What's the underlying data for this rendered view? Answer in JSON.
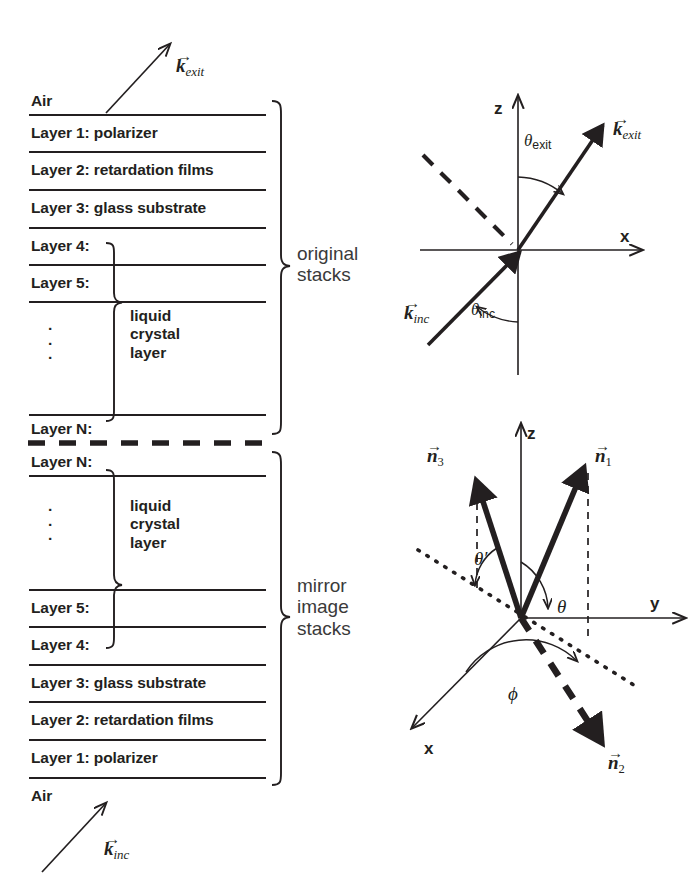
{
  "figure": {
    "background": "#ffffff",
    "ink": "#231f20",
    "side_label_color": "#3a3a3a"
  },
  "stack_original": {
    "group_label": "original stacks",
    "group_label_line1": "original",
    "group_label_line2": "stacks",
    "top_medium": "Air",
    "layers": [
      "Layer 1: polarizer",
      "Layer 2: retardation films",
      "Layer 3: glass substrate",
      "Layer 4:",
      "Layer 5:",
      "Layer N:"
    ],
    "ellipsis": "·",
    "lc_label_line1": "liquid",
    "lc_label_line2": "crystal",
    "lc_label_line3": "layer",
    "arrow_label": "k",
    "arrow_label_sub": "exit"
  },
  "stack_mirror": {
    "group_label": "mirror image stacks",
    "group_label_line1": "mirror",
    "group_label_line2": "image",
    "group_label_line3": "stacks",
    "bottom_medium": "Air",
    "layers": [
      "Layer N:",
      "Layer 5:",
      "Layer 4:",
      "Layer 3: glass substrate",
      "Layer 2: retardation films",
      "Layer 1: polarizer"
    ],
    "ellipsis": "·",
    "lc_label_line1": "liquid",
    "lc_label_line2": "crystal",
    "lc_label_line3": "layer",
    "arrow_label": "k",
    "arrow_label_sub": "inc"
  },
  "coord_top": {
    "axis_z": "z",
    "axis_x": "x",
    "angle_exit": "θ",
    "angle_exit_sub": "exit",
    "angle_inc": "θ",
    "angle_inc_sub": "inc",
    "vector_exit": "k",
    "vector_exit_sub": "exit",
    "vector_inc": "k",
    "vector_inc_sub": "inc"
  },
  "coord_bottom": {
    "axis_z": "z",
    "axis_y": "y",
    "axis_x": "x",
    "vector_n1": "n",
    "vector_n1_sub": "1",
    "vector_n2": "n",
    "vector_n2_sub": "2",
    "vector_n3": "n",
    "vector_n3_sub": "3",
    "angle_theta": "θ",
    "angle_theta_prime": "θ′",
    "angle_phi": "ϕ"
  }
}
